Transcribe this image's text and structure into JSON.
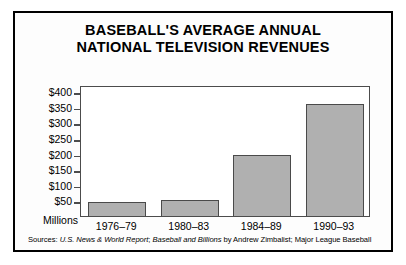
{
  "figure": {
    "title_line_1": "BASEBALL'S AVERAGE ANNUAL",
    "title_line_2": "NATIONAL TELEVISION REVENUES",
    "units_label": "Millions",
    "source_prefix": "Sources: ",
    "source_italic_1": "U.S. News & World Report",
    "source_sep_1": "; ",
    "source_italic_2": "Baseball and Billions",
    "source_tail": " by Andrew Zimbalist; Major League Baseball",
    "frame_color": "#000000",
    "bar_fill": "#b0b0b0",
    "bar_edge": "#4a4a4a",
    "axis_color": "#4c4c4c"
  },
  "chart_data": {
    "type": "bar",
    "title": "BASEBALL'S AVERAGE ANNUAL NATIONAL TELEVISION REVENUES",
    "xlabel": "",
    "ylabel": "Millions",
    "categories": [
      "1976–79",
      "1980–83",
      "1984–89",
      "1990–93"
    ],
    "values": [
      45,
      50,
      195,
      360
    ],
    "ylim": [
      0,
      420
    ],
    "yticks": [
      50,
      100,
      150,
      200,
      250,
      300,
      350,
      400
    ],
    "ytick_labels": [
      "$50",
      "$100",
      "$150",
      "$200",
      "$250",
      "$300",
      "$350",
      "$400"
    ],
    "grid": false,
    "legend": "none"
  }
}
